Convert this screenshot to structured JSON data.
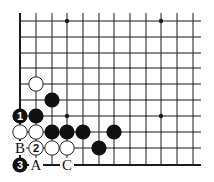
{
  "diagram": {
    "type": "go-board-fragment",
    "grid": {
      "columns_x": [
        20,
        36,
        52,
        67,
        83,
        99,
        114,
        130,
        146,
        161,
        177,
        193
      ],
      "rows_y": [
        21,
        37,
        53,
        68,
        84,
        100,
        116,
        132,
        148,
        165
      ],
      "right_extent": 201,
      "top_extent": 13,
      "left_edge_thick": true,
      "bottom_edge_thick": true
    },
    "star_points": [
      {
        "col": 3,
        "row": 0
      },
      {
        "col": 9,
        "row": 0
      },
      {
        "col": 3,
        "row": 6
      },
      {
        "col": 9,
        "row": 6
      }
    ],
    "stones": [
      {
        "color": "white",
        "col": 1,
        "row": 4,
        "label": ""
      },
      {
        "color": "black",
        "col": 2,
        "row": 5,
        "label": ""
      },
      {
        "color": "black",
        "col": 0,
        "row": 6,
        "label": "1"
      },
      {
        "color": "black",
        "col": 1,
        "row": 6,
        "label": ""
      },
      {
        "color": "white",
        "col": 0,
        "row": 7,
        "label": ""
      },
      {
        "color": "white",
        "col": 1,
        "row": 7,
        "label": ""
      },
      {
        "color": "black",
        "col": 2,
        "row": 7,
        "label": ""
      },
      {
        "color": "black",
        "col": 3,
        "row": 7,
        "label": ""
      },
      {
        "color": "black",
        "col": 4,
        "row": 7,
        "label": ""
      },
      {
        "color": "black",
        "col": 6,
        "row": 7,
        "label": ""
      },
      {
        "color": "white",
        "col": 1,
        "row": 8,
        "label": "2"
      },
      {
        "color": "white",
        "col": 2,
        "row": 8,
        "label": ""
      },
      {
        "color": "white",
        "col": 3,
        "row": 8,
        "label": ""
      },
      {
        "color": "black",
        "col": 5,
        "row": 8,
        "label": ""
      },
      {
        "color": "black",
        "col": 0,
        "row": 9,
        "label": "3"
      }
    ],
    "point_labels": [
      {
        "text": "B",
        "col": 0,
        "row": 8
      },
      {
        "text": "A",
        "col": 1,
        "row": 9
      },
      {
        "text": "C",
        "col": 3,
        "row": 9
      }
    ],
    "colors": {
      "line": "#1a1a1a",
      "black_stone": "#111111",
      "white_stone_fill": "#ffffff",
      "white_stone_stroke": "#222222"
    }
  }
}
